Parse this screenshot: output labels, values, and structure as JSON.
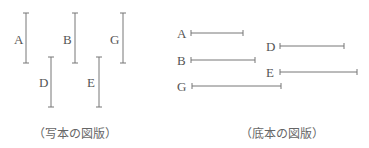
{
  "figures": {
    "manuscript": {
      "caption": "（写本の図版）",
      "orientation": "vertical",
      "segments": [
        {
          "label": "A",
          "x": 26,
          "y1": 13,
          "y2": 63,
          "lx": 14,
          "ly": 44
        },
        {
          "label": "B",
          "x": 75,
          "y1": 13,
          "y2": 63,
          "lx": 63,
          "ly": 44
        },
        {
          "label": "G",
          "x": 123,
          "y1": 13,
          "y2": 63,
          "lx": 110,
          "ly": 44
        },
        {
          "label": "D",
          "x": 51,
          "y1": 57,
          "y2": 107,
          "lx": 39,
          "ly": 87
        },
        {
          "label": "E",
          "x": 99,
          "y1": 57,
          "y2": 107,
          "lx": 87,
          "ly": 87
        }
      ]
    },
    "base_text": {
      "caption": "（底本の図版）",
      "orientation": "horizontal",
      "segments": [
        {
          "label": "A",
          "y": 33,
          "x1": 191,
          "x2": 243,
          "lx": 177,
          "ly": 38
        },
        {
          "label": "B",
          "y": 60,
          "x1": 191,
          "x2": 255,
          "lx": 177,
          "ly": 65
        },
        {
          "label": "G",
          "y": 86,
          "x1": 192,
          "x2": 281,
          "lx": 177,
          "ly": 91
        },
        {
          "label": "D",
          "y": 46,
          "x1": 280,
          "x2": 344,
          "lx": 266,
          "ly": 51
        },
        {
          "label": "E",
          "y": 72,
          "x1": 280,
          "x2": 357,
          "lx": 266,
          "ly": 77
        }
      ]
    }
  }
}
